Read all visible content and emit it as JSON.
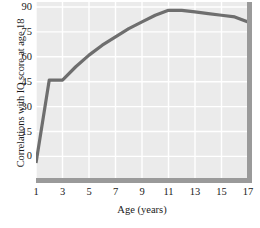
{
  "chart_data": {
    "type": "line",
    "title": "",
    "xlabel": "Age (years)",
    "ylabel": "Correlations with IQ score at age 18",
    "xlim": [
      1,
      17
    ],
    "ylim": [
      -13,
      93
    ],
    "xticks": [
      1,
      3,
      5,
      7,
      9,
      11,
      13,
      15,
      17
    ],
    "xtick_labels": [
      "1",
      "3",
      "5",
      "7",
      "9",
      "11",
      "13",
      "15",
      "17"
    ],
    "yticks": [
      0,
      15,
      30,
      45,
      60,
      75,
      90
    ],
    "ytick_labels": [
      "0",
      "15",
      "30",
      "45",
      "60",
      "75",
      "90"
    ],
    "grid": true,
    "grid_color": "#ffffff",
    "plot_background": "#ebebeb",
    "line_color": "#6e6e6e",
    "spine_color": "#9a9a9a",
    "legend": null,
    "series": [
      {
        "name": "Correlation with age-18 IQ",
        "x": [
          1,
          2,
          3,
          4,
          5,
          6,
          7,
          8,
          9,
          10,
          11,
          12,
          13,
          14,
          15,
          16,
          17
        ],
        "values": [
          -4,
          46,
          46,
          54,
          61,
          67,
          72,
          77,
          81,
          85,
          88,
          88,
          87,
          86,
          85,
          84,
          81
        ]
      }
    ]
  }
}
